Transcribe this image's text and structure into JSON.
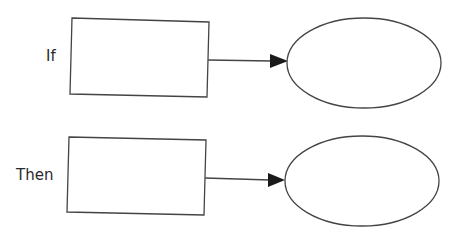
{
  "diagram": {
    "type": "if-then flow",
    "rows": [
      {
        "id": "if",
        "label": "If",
        "box_text": "",
        "ellipse_text": ""
      },
      {
        "id": "then",
        "label": "Then",
        "box_text": "",
        "ellipse_text": ""
      }
    ],
    "colors": {
      "stroke": "#444444",
      "arrowhead": "#1a1a1a",
      "text": "#2a2a2a",
      "background": "#ffffff"
    }
  }
}
